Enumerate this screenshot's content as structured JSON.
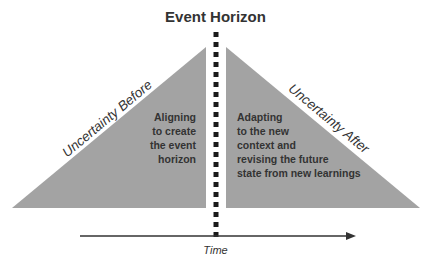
{
  "diagram": {
    "title": "Event Horizon",
    "left_triangle": {
      "edge_label": "Uncertainty Before",
      "lines": [
        "Aligning",
        "to create",
        "the event",
        "horizon"
      ],
      "fill": "#a3a3a3"
    },
    "right_triangle": {
      "edge_label": "Uncertainty After",
      "lines": [
        "Adapting",
        "to the new",
        "context and",
        "revising the future",
        "state from new learnings"
      ],
      "fill": "#a3a3a3"
    },
    "divider": {
      "style": "dotted",
      "color": "#1a1a1a"
    },
    "axis": {
      "label": "Time",
      "color": "#333333"
    }
  }
}
